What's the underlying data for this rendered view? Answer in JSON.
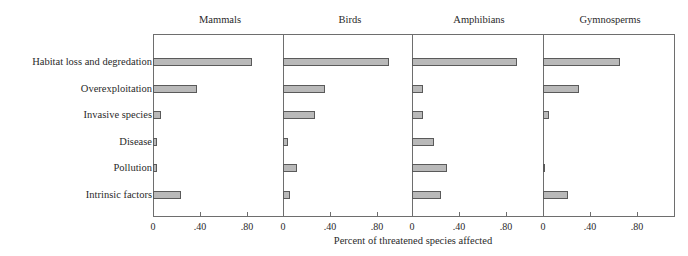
{
  "chart_data": {
    "type": "bar",
    "orientation": "horizontal",
    "title": "",
    "xlabel": "Percent of threatened species affected",
    "ylabel": "",
    "xlim": [
      0,
      1.1
    ],
    "x_ticks": [
      "0",
      ".40",
      ".80"
    ],
    "grid": false,
    "legend": null,
    "categories": [
      "Habitat loss and degredation",
      "Overexploitation",
      "Invasive species",
      "Disease",
      "Pollution",
      "Intrinsic factors"
    ],
    "panels": [
      {
        "name": "Mammals",
        "values": [
          0.85,
          0.38,
          0.07,
          0.03,
          0.03,
          0.24
        ]
      },
      {
        "name": "Birds",
        "values": [
          0.91,
          0.36,
          0.27,
          0.04,
          0.12,
          0.06
        ]
      },
      {
        "name": "Amphibians",
        "values": [
          0.9,
          0.09,
          0.09,
          0.19,
          0.3,
          0.25
        ]
      },
      {
        "name": "Gymnosperms",
        "values": [
          0.66,
          0.31,
          0.05,
          0.0,
          0.01,
          0.21
        ]
      }
    ]
  },
  "colors": {
    "bar_fill": "#b9b9b9",
    "bar_border": "#5a5a5a",
    "axis": "#6e6e6e",
    "text": "#2a2a2a"
  }
}
